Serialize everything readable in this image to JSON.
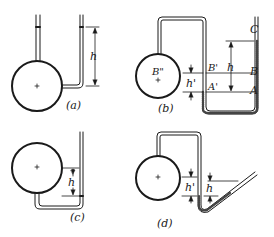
{
  "figure": {
    "panels": [
      {
        "id": "a",
        "caption": "(a)",
        "labels": {
          "h": "h"
        }
      },
      {
        "id": "b",
        "caption": "(b)",
        "labels": {
          "h": "h",
          "h_prime": "h'",
          "A": "A",
          "B": "B",
          "C": "C",
          "A_prime": "A'",
          "B_prime": "B'",
          "B_dprime": "B\""
        }
      },
      {
        "id": "c",
        "caption": "(c)",
        "labels": {
          "h": "h"
        }
      },
      {
        "id": "d",
        "caption": "(d)",
        "labels": {
          "h": "h",
          "h_prime": "h'"
        }
      }
    ],
    "center_mark": "+",
    "colors": {
      "ink": "#1a1a1a",
      "background": "#ffffff"
    }
  }
}
